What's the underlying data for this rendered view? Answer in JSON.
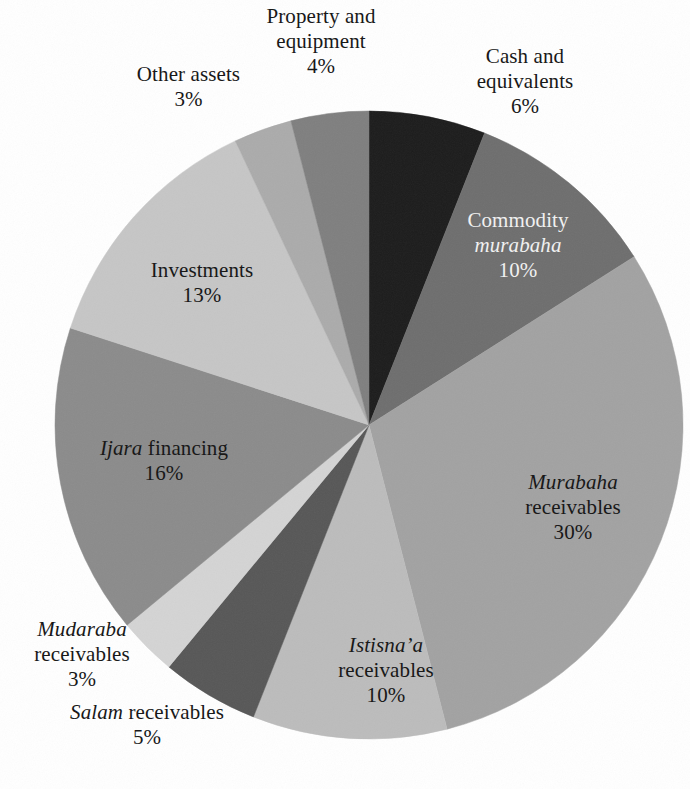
{
  "chart_data": {
    "type": "pie",
    "title": "",
    "subtitle": "",
    "xlabel": "",
    "ylabel": "",
    "units": "percent",
    "total": 100,
    "start_angle_deg": 0,
    "direction": "clockwise",
    "legend_position": "none",
    "labels_position": "mixed-inside-and-outside",
    "grid": false,
    "center": {
      "x": 369,
      "y": 425
    },
    "radius": 314,
    "categories": [
      "Cash and equivalents",
      "Commodity murabaha",
      "Murabaha receivables",
      "Istisna'a receivables",
      "Salam receivables",
      "Mudaraba receivables",
      "Ijara financing",
      "Investments",
      "Other assets",
      "Property and equipment"
    ],
    "values": [
      6,
      10,
      30,
      10,
      5,
      3,
      16,
      13,
      3,
      4
    ],
    "slices": [
      {
        "key": "cash",
        "name": "Cash and equivalents",
        "value": 6,
        "value_text": "6%",
        "color": "#1c1c1c",
        "label_placement": "outside",
        "lines": [
          "Cash and",
          "equivalents"
        ],
        "italic_lines": []
      },
      {
        "key": "commodity_murabaha",
        "name": "Commodity murabaha",
        "value": 10,
        "value_text": "10%",
        "color": "#6e6e6e",
        "label_placement": "inside",
        "text_color": "#f2f2f2",
        "lines": [
          "Commodity",
          "murabaha"
        ],
        "italic_lines": [
          "murabaha"
        ]
      },
      {
        "key": "murabaha_receivables",
        "name": "Murabaha receivables",
        "value": 30,
        "value_text": "30%",
        "color": "#a2a2a2",
        "label_placement": "inside",
        "text_color": "#141414",
        "lines": [
          "Murabaha",
          "receivables"
        ],
        "italic_lines": [
          "Murabaha"
        ]
      },
      {
        "key": "istisna_receivables",
        "name": "Istisna'a receivables",
        "value": 10,
        "value_text": "10%",
        "color": "#bcbcbc",
        "label_placement": "inside",
        "text_color": "#141414",
        "lines": [
          "Istisna’a",
          "receivables"
        ],
        "italic_lines": [
          "Istisna’a"
        ]
      },
      {
        "key": "salam_receivables",
        "name": "Salam receivables",
        "value": 5,
        "value_text": "5%",
        "color": "#575757",
        "label_placement": "outside",
        "lines": [
          "Salam receivables"
        ],
        "italic_lines": [
          "Salam"
        ]
      },
      {
        "key": "mudaraba_receivables",
        "name": "Mudaraba receivables",
        "value": 3,
        "value_text": "3%",
        "color": "#d4d4d4",
        "label_placement": "outside",
        "lines": [
          "Mudaraba",
          "receivables"
        ],
        "italic_lines": [
          "Mudaraba"
        ]
      },
      {
        "key": "ijara_financing",
        "name": "Ijara financing",
        "value": 16,
        "value_text": "16%",
        "color": "#8b8b8b",
        "label_placement": "inside",
        "text_color": "#141414",
        "lines": [
          "Ijara financing"
        ],
        "italic_lines": [
          "Ijara"
        ]
      },
      {
        "key": "investments",
        "name": "Investments",
        "value": 13,
        "value_text": "13%",
        "color": "#c6c6c6",
        "label_placement": "inside",
        "text_color": "#141414",
        "lines": [
          "Investments"
        ],
        "italic_lines": []
      },
      {
        "key": "other_assets",
        "name": "Other assets",
        "value": 3,
        "value_text": "3%",
        "color": "#ababab",
        "label_placement": "outside",
        "lines": [
          "Other assets"
        ],
        "italic_lines": []
      },
      {
        "key": "property_equipment",
        "name": "Property and equipment",
        "value": 4,
        "value_text": "4%",
        "color": "#7f7f7f",
        "label_placement": "outside",
        "lines": [
          "Property and",
          "equipment"
        ],
        "italic_lines": []
      }
    ]
  },
  "labels": {
    "property": {
      "line1": "Property and",
      "line2": "equipment",
      "pct": "4%"
    },
    "cash": {
      "line1": "Cash and",
      "line2": "equivalents",
      "pct": "6%"
    },
    "other_assets": {
      "line1": "Other assets",
      "pct": "3%"
    },
    "investments": {
      "line1": "Investments",
      "pct": "13%"
    },
    "ijara": {
      "italic": "Ijara",
      "rest": " financing",
      "pct": "16%"
    },
    "mudaraba": {
      "italic": "Mudaraba",
      "line2": "receivables",
      "pct": "3%"
    },
    "salam": {
      "italic": "Salam",
      "rest": " receivables",
      "pct": "5%"
    },
    "istisna": {
      "italic": "Istisna’a",
      "line2": "receivables",
      "pct": "10%"
    },
    "murabaha": {
      "italic": "Murabaha",
      "line2": "receivables",
      "pct": "30%"
    },
    "commodity": {
      "line1": "Commodity",
      "italic": "murabaha",
      "pct": "10%"
    }
  },
  "colors": {
    "background": "#ffffff",
    "text": "#141414",
    "text_on_dark": "#f2f2f2"
  }
}
